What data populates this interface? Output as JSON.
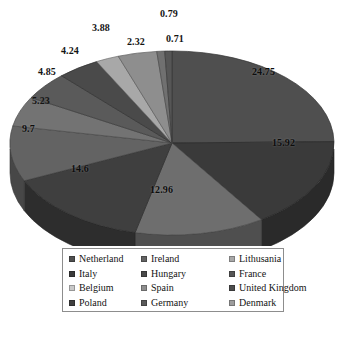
{
  "chart_data": {
    "type": "pie",
    "title": "",
    "subtitle": "",
    "xlabel": "",
    "ylabel": "",
    "grid": false,
    "legend_position": "bottom",
    "three_d": true,
    "categories": [
      "Netherland",
      "Italy",
      "Belgium",
      "Poland",
      "Ireland",
      "Hungary",
      "Spain",
      "Germany",
      "Lithusania",
      "France",
      "United Kingdom",
      "Denmark"
    ],
    "values": [
      24.75,
      15.92,
      12.96,
      14.6,
      9.7,
      5.23,
      4.85,
      4.24,
      2.32,
      3.88,
      0.79,
      0.71
    ],
    "data_labels": [
      "24.75",
      "15.92",
      "12.96",
      "14.6",
      "9.7",
      "5.23",
      "4.85",
      "4.24",
      "2.32",
      "3.88",
      "0.79",
      "0.71"
    ],
    "slice_colors": [
      "#4f4f4f",
      "#3a3a3a",
      "#6e6e6e",
      "#3f3f3f",
      "#636363",
      "#737373",
      "#5a5a5a",
      "#4a4a4a",
      "#a8a8a8",
      "#8e8e8e",
      "#707070",
      "#565656"
    ]
  },
  "labels": [
    {
      "text": "24.75",
      "x": 252,
      "y": 66,
      "inside": true
    },
    {
      "text": "15.92",
      "x": 272,
      "y": 137,
      "inside": true
    },
    {
      "text": "12.96",
      "x": 150,
      "y": 184,
      "inside": true
    },
    {
      "text": "14.6",
      "x": 71,
      "y": 163,
      "inside": true
    },
    {
      "text": "9.7",
      "x": 22,
      "y": 123,
      "inside": true
    },
    {
      "text": "5.23",
      "x": 32,
      "y": 95,
      "inside": false
    },
    {
      "text": "4.85",
      "x": 38,
      "y": 66,
      "inside": false
    },
    {
      "text": "4.24",
      "x": 61,
      "y": 45,
      "inside": false
    },
    {
      "text": "3.88",
      "x": 92,
      "y": 22,
      "inside": false
    },
    {
      "text": "2.32",
      "x": 127,
      "y": 36,
      "inside": false
    },
    {
      "text": "0.79",
      "x": 160,
      "y": 8,
      "inside": false
    },
    {
      "text": "0.71",
      "x": 166,
      "y": 33,
      "inside": false
    }
  ],
  "legend": {
    "items": [
      {
        "label": "Netherland",
        "color": "#4f4f4f"
      },
      {
        "label": "Italy",
        "color": "#3a3a3a"
      },
      {
        "label": "Belgium",
        "color": "#c9c9c9"
      },
      {
        "label": "Poland",
        "color": "#3f3f3f"
      },
      {
        "label": "Ireland",
        "color": "#636363"
      },
      {
        "label": "Hungary",
        "color": "#4a4a4a"
      },
      {
        "label": "Spain",
        "color": "#8e8e8e"
      },
      {
        "label": "Germany",
        "color": "#5a5a5a"
      },
      {
        "label": "Lithusania",
        "color": "#a8a8a8"
      },
      {
        "label": "France",
        "color": "#565656"
      },
      {
        "label": "United Kingdom",
        "color": "#4d4d4d"
      },
      {
        "label": "Denmark",
        "color": "#9d9d9d"
      }
    ]
  }
}
